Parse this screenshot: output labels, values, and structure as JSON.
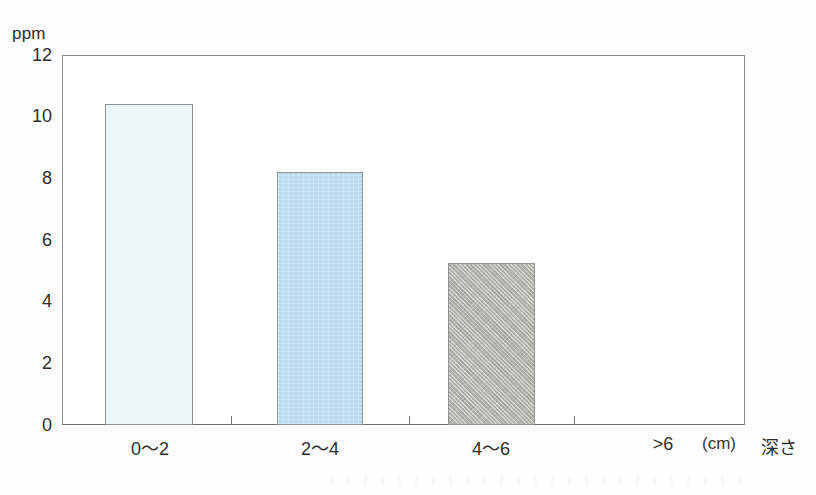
{
  "chart_data": {
    "type": "bar",
    "title": "",
    "subtitle": "",
    "xlabel": "深さ",
    "x_unit": "(cm)",
    "ylabel": "ppm",
    "categories": [
      "0〜2",
      "2〜4",
      "4〜6",
      ">6"
    ],
    "values": [
      10.4,
      8.2,
      5.25,
      0
    ],
    "series": [
      {
        "name": "ppm",
        "values": [
          10.4,
          8.2,
          5.25,
          0
        ]
      }
    ],
    "ylim": [
      0,
      12
    ],
    "ytick_labels": [
      "12",
      "10",
      "8",
      "6",
      "4",
      "2",
      "0"
    ],
    "ytick_values": [
      12,
      10,
      8,
      6,
      4,
      2,
      0
    ],
    "grid": false,
    "legend": "none",
    "bar_styles": [
      {
        "category": "0〜2",
        "fill": "#eaf6fa",
        "pattern": "solid-light",
        "border": "#8f9395"
      },
      {
        "category": "2〜4",
        "fill": "#b9dcf0",
        "pattern": "solid-blue",
        "border": "#8f9395"
      },
      {
        "category": "4〜6",
        "fill": "#b4b4ad",
        "pattern": "hatch-gray",
        "border": "#8f9395"
      },
      {
        "category": ">6",
        "fill": "none",
        "pattern": "none",
        "border": "none"
      }
    ],
    "axis_color": "#8a8a8a",
    "text_color": "#2e2e2e"
  }
}
